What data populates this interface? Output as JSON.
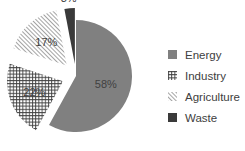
{
  "chart_data": {
    "type": "pie",
    "title": "",
    "categories": [
      "Energy",
      "Industry",
      "Agriculture",
      "Waste"
    ],
    "values": [
      58,
      22,
      17,
      3
    ],
    "labels": [
      "58%",
      "22%",
      "17%",
      "3%"
    ],
    "patterns": [
      "solid",
      "grid-hatch",
      "diagonal-hatch",
      "solid"
    ],
    "colors": [
      "#808080",
      "#505050",
      "#909090",
      "#3a3a3a"
    ],
    "exploded": true,
    "start_angle_deg": 0,
    "direction": "clockwise",
    "legend_position": "right"
  },
  "legend": {
    "items": [
      {
        "label": "Energy"
      },
      {
        "label": "Industry"
      },
      {
        "label": "Agriculture"
      },
      {
        "label": "Waste"
      }
    ]
  }
}
